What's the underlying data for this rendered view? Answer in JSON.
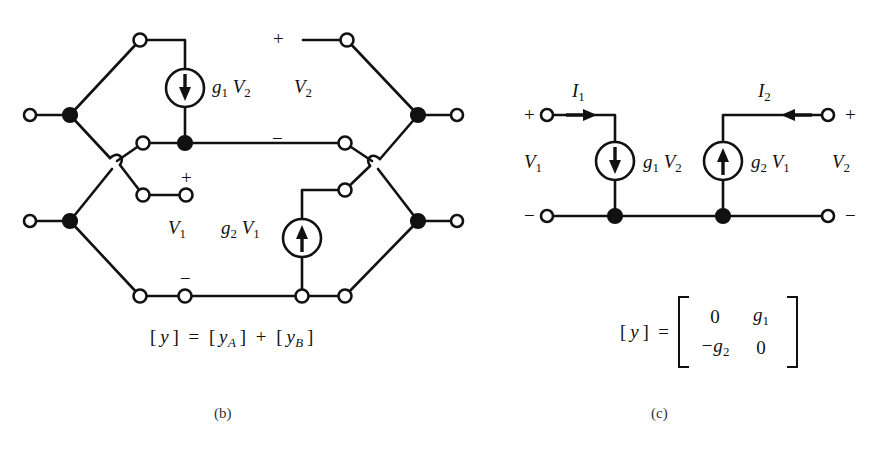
{
  "figure": {
    "caption_b": "(b)",
    "caption_c": "(c)"
  },
  "panel_b": {
    "name": "parallel-connected-two-port-network",
    "source_top": {
      "label_g": "g",
      "label_g_sub": "1",
      "label_v": "V",
      "label_v_sub": "2",
      "full": "g1 V2",
      "direction": "down"
    },
    "source_bottom": {
      "label_g": "g",
      "label_g_sub": "2",
      "label_v": "V",
      "label_v_sub": "1",
      "full": "g2 V1",
      "direction": "up"
    },
    "port_v2": {
      "label": "V",
      "sub": "2",
      "plus": "+",
      "minus": "−"
    },
    "port_v1": {
      "label": "V",
      "sub": "1",
      "plus": "+",
      "minus": "−"
    },
    "equation": {
      "lhs": "[ y ]",
      "eq": "=",
      "term_a": "[ y",
      "term_a_sub": "A",
      "term_a_close": " ]",
      "plus": "+",
      "term_b": "[ y",
      "term_b_sub": "B",
      "term_b_close": " ]"
    }
  },
  "panel_c": {
    "name": "equivalent-two-port-gyrator-model",
    "current_1": {
      "label": "I",
      "sub": "1"
    },
    "current_2": {
      "label": "I",
      "sub": "2"
    },
    "source_left": {
      "label_g": "g",
      "label_g_sub": "1",
      "label_v": "V",
      "label_v_sub": "2",
      "direction": "down"
    },
    "source_right": {
      "label_g": "g",
      "label_g_sub": "2",
      "label_v": "V",
      "label_v_sub": "1",
      "direction": "up"
    },
    "port_left": {
      "label": "V",
      "sub": "1",
      "plus": "+",
      "minus": "−"
    },
    "port_right": {
      "label": "V",
      "sub": "2",
      "plus": "+",
      "minus": "−"
    },
    "matrix": {
      "lhs": "[ y ]  =",
      "rows": [
        [
          {
            "text": "0",
            "italic": false
          },
          {
            "text": "g",
            "sub": "1",
            "italic": true
          }
        ],
        [
          {
            "text": "−g",
            "sub": "2",
            "italic": true
          },
          {
            "text": "0",
            "italic": false
          }
        ]
      ]
    }
  },
  "colors": {
    "ink": "#111111",
    "background": "#ffffff"
  }
}
